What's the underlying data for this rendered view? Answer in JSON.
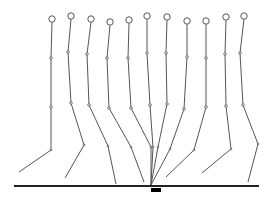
{
  "diagram": {
    "title": "",
    "colors": {
      "line": "#555555",
      "ground": "#222222",
      "marker": "#000000",
      "background": "#ffffff"
    },
    "ground": {
      "x1": 14,
      "x2": 259,
      "y": 186
    },
    "marker": {
      "x": 151,
      "y": 188,
      "width": 10,
      "height": 4
    },
    "figures": [
      {
        "head": [
          52,
          19
        ],
        "hip": [
          51,
          58
        ],
        "joint": [
          51,
          107
        ],
        "knee": [
          51,
          150
        ],
        "foot": [
          19,
          172
        ]
      },
      {
        "head": [
          71,
          16
        ],
        "hip": [
          68,
          52
        ],
        "joint": [
          71,
          103
        ],
        "knee": [
          84,
          145
        ],
        "foot": [
          65,
          178
        ]
      },
      {
        "head": [
          91,
          19
        ],
        "hip": [
          87,
          54
        ],
        "joint": [
          89,
          105
        ],
        "knee": [
          108,
          146
        ],
        "foot": [
          116,
          184
        ]
      },
      {
        "head": [
          110,
          22
        ],
        "hip": [
          107,
          58
        ],
        "joint": [
          109,
          108
        ],
        "knee": [
          131,
          147
        ],
        "foot": [
          144,
          182
        ]
      },
      {
        "head": [
          129,
          20
        ],
        "hip": [
          128,
          58
        ],
        "joint": [
          131,
          108
        ],
        "knee": [
          151,
          147
        ],
        "foot": [
          151,
          185
        ]
      },
      {
        "head": [
          147,
          16
        ],
        "hip": [
          147,
          53
        ],
        "joint": [
          150,
          105
        ],
        "knee": [
          153,
          147
        ],
        "foot": [
          151,
          185
        ]
      },
      {
        "head": [
          167,
          17
        ],
        "hip": [
          166,
          53
        ],
        "joint": [
          167,
          104
        ],
        "knee": [
          158,
          147
        ],
        "foot": [
          151,
          185
        ]
      },
      {
        "head": [
          187,
          21
        ],
        "hip": [
          187,
          57
        ],
        "joint": [
          184,
          109
        ],
        "knee": [
          170,
          149
        ],
        "foot": [
          151,
          185
        ]
      },
      {
        "head": [
          206,
          21
        ],
        "hip": [
          206,
          58
        ],
        "joint": [
          206,
          107
        ],
        "knee": [
          194,
          150
        ],
        "foot": [
          166,
          177
        ]
      },
      {
        "head": [
          226,
          17
        ],
        "hip": [
          225,
          54
        ],
        "joint": [
          226,
          106
        ],
        "knee": [
          231,
          149
        ],
        "foot": [
          202,
          173
        ]
      },
      {
        "head": [
          244,
          16
        ],
        "hip": [
          240,
          53
        ],
        "joint": [
          243,
          105
        ],
        "knee": [
          258,
          144
        ],
        "foot": [
          248,
          182
        ]
      }
    ]
  }
}
